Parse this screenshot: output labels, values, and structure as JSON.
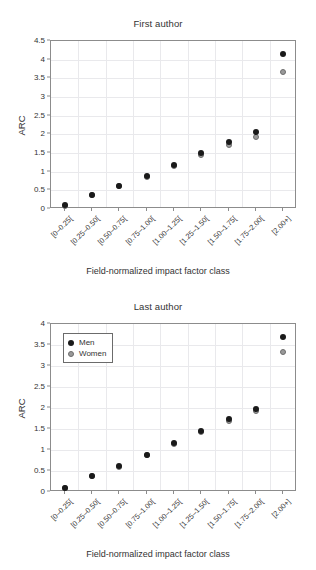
{
  "figure": {
    "width": 316,
    "height": 570,
    "background": "#ffffff",
    "men_color": "#1a1a1a",
    "women_color": "#9a9a9a"
  },
  "chart_data": [
    {
      "type": "scatter",
      "title": "First author",
      "xlabel": "Field-normalized impact factor class",
      "ylabel": "ARC",
      "categories": [
        "[0–0.25[",
        "[0.25–0.50[",
        "[0.50–0.75[",
        "[0.75–1.00[",
        "[1.00–1.25[",
        "[1.25–1.50[",
        "[1.50–1.75[",
        "[1.75–2.00[",
        "[2.00+]"
      ],
      "series": [
        {
          "name": "Men",
          "color": "#1a1a1a",
          "values": [
            0.1,
            0.38,
            0.62,
            0.89,
            1.17,
            1.49,
            1.79,
            2.07,
            4.15
          ]
        },
        {
          "name": "Women",
          "color": "#9a9a9a",
          "values": [
            0.09,
            0.37,
            0.61,
            0.87,
            1.15,
            1.44,
            1.71,
            1.92,
            3.68
          ]
        }
      ],
      "ylim": [
        0,
        4.5
      ],
      "yticks": [
        0,
        0.5,
        1,
        1.5,
        2,
        2.5,
        3,
        3.5,
        4,
        4.5
      ],
      "ytick_labels": [
        "0",
        "0.5",
        "1",
        "1.5",
        "2",
        "2.5",
        "3",
        "3.5",
        "4",
        "4.5"
      ],
      "grid": true,
      "legend": null
    },
    {
      "type": "scatter",
      "title": "Last author",
      "xlabel": "Field-normalized impact factor class",
      "ylabel": "ARC",
      "categories": [
        "[0–0.25[",
        "[0.25–0.50[",
        "[0.50–0.75[",
        "[0.75–1.00[",
        "[1.00–1.25[",
        "[1.25–1.50[",
        "[1.50–1.75[",
        "[1.75–2.00[",
        "[2.00+]"
      ],
      "series": [
        {
          "name": "Men",
          "color": "#1a1a1a",
          "values": [
            0.1,
            0.38,
            0.61,
            0.88,
            1.16,
            1.45,
            1.74,
            1.98,
            3.68
          ]
        },
        {
          "name": "Women",
          "color": "#9a9a9a",
          "values": [
            0.09,
            0.37,
            0.6,
            0.87,
            1.15,
            1.42,
            1.7,
            1.92,
            3.34
          ]
        }
      ],
      "ylim": [
        0,
        4
      ],
      "yticks": [
        0,
        0.5,
        1,
        1.5,
        2,
        2.5,
        3,
        3.5,
        4
      ],
      "ytick_labels": [
        "0",
        "0.5",
        "1",
        "1.5",
        "2",
        "2.5",
        "3",
        "3.5",
        "4"
      ],
      "grid": true,
      "legend": {
        "position": "top-left",
        "entries": [
          {
            "label": "Men",
            "color": "#1a1a1a"
          },
          {
            "label": "Women",
            "color": "#9a9a9a"
          }
        ]
      }
    }
  ]
}
